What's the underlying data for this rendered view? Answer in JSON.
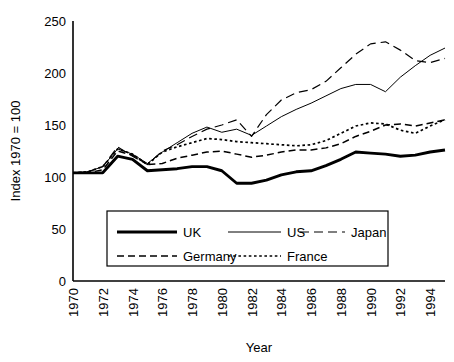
{
  "chart_data": {
    "type": "line",
    "title": "",
    "xlabel": "Year",
    "ylabel": "Index 1970 = 100",
    "xlim": [
      1970,
      1995
    ],
    "ylim": [
      0,
      250
    ],
    "yticks": [
      0,
      50,
      100,
      150,
      200,
      250
    ],
    "xticks": [
      1970,
      1972,
      1974,
      1976,
      1978,
      1980,
      1982,
      1984,
      1986,
      1988,
      1990,
      1992,
      1994
    ],
    "grid": false,
    "legend_position": "inside-bottom-center",
    "x": [
      1970,
      1971,
      1972,
      1973,
      1974,
      1975,
      1976,
      1977,
      1978,
      1979,
      1980,
      1981,
      1982,
      1983,
      1984,
      1985,
      1986,
      1987,
      1988,
      1989,
      1990,
      1991,
      1992,
      1993,
      1994,
      1995
    ],
    "series": [
      {
        "name": "UK",
        "style": "solid-thick",
        "values": [
          104,
          104,
          104,
          120,
          117,
          106,
          107,
          108,
          110,
          110,
          106,
          94,
          94,
          97,
          102,
          105,
          106,
          111,
          117,
          124,
          123,
          122,
          120,
          121,
          124,
          126
        ]
      },
      {
        "name": "US",
        "style": "solid-thin",
        "values": [
          104,
          105,
          110,
          127,
          122,
          113,
          124,
          133,
          142,
          148,
          143,
          146,
          140,
          149,
          158,
          165,
          171,
          178,
          185,
          189,
          189,
          182,
          196,
          207,
          217,
          224
        ]
      },
      {
        "name": "Japan",
        "style": "long-dash",
        "values": [
          104,
          105,
          110,
          129,
          120,
          112,
          125,
          131,
          139,
          146,
          150,
          155,
          139,
          160,
          174,
          181,
          184,
          192,
          205,
          218,
          228,
          230,
          222,
          212,
          210,
          214
        ]
      },
      {
        "name": "Germany",
        "style": "medium-dash",
        "values": [
          104,
          104,
          107,
          125,
          121,
          112,
          113,
          118,
          121,
          124,
          125,
          122,
          119,
          121,
          124,
          126,
          126,
          128,
          132,
          139,
          144,
          150,
          151,
          149,
          152,
          155
        ]
      },
      {
        "name": "France",
        "style": "dotted",
        "values": [
          104,
          105,
          110,
          127,
          122,
          112,
          124,
          129,
          133,
          137,
          136,
          134,
          133,
          132,
          131,
          130,
          131,
          135,
          142,
          149,
          152,
          151,
          145,
          142,
          149,
          155
        ]
      }
    ],
    "legend": [
      {
        "label": "UK",
        "style": "solid-thick"
      },
      {
        "label": "US",
        "style": "solid-thin"
      },
      {
        "label": "Japan",
        "style": "long-dash"
      },
      {
        "label": "Germany",
        "style": "medium-dash"
      },
      {
        "label": "France",
        "style": "dotted"
      }
    ]
  },
  "axes": {
    "y_label": "Index 1970 = 100",
    "x_label": "Year",
    "y_tick_labels": [
      "0",
      "50",
      "100",
      "150",
      "200",
      "250"
    ],
    "x_tick_labels": [
      "1970",
      "1972",
      "1974",
      "1976",
      "1978",
      "1980",
      "1982",
      "1984",
      "1986",
      "1988",
      "1990",
      "1992",
      "1994"
    ]
  },
  "legend": {
    "uk": "UK",
    "us": "US",
    "japan": "Japan",
    "germany": "Germany",
    "france": "France"
  },
  "colors": {
    "line": "#000000",
    "background": "#ffffff"
  }
}
